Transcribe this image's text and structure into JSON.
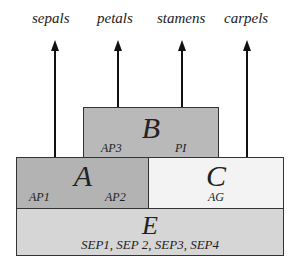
{
  "organs": [
    "sepals",
    "petals",
    "stamens",
    "carpels"
  ],
  "boxes": {
    "B": {
      "letter": "B",
      "genes": [
        "AP3",
        "PI"
      ],
      "color": "#b9b9b9"
    },
    "A": {
      "letter": "A",
      "genes": [
        "AP1",
        "AP2"
      ],
      "color": "#b3b3b3"
    },
    "C": {
      "letter": "C",
      "genes": [
        "AG"
      ],
      "color": "#f3f3f3"
    },
    "E": {
      "letter": "E",
      "genes_text": "SEP1, SEP 2, SEP3, SEP4",
      "color": "#d6d6d6"
    }
  }
}
